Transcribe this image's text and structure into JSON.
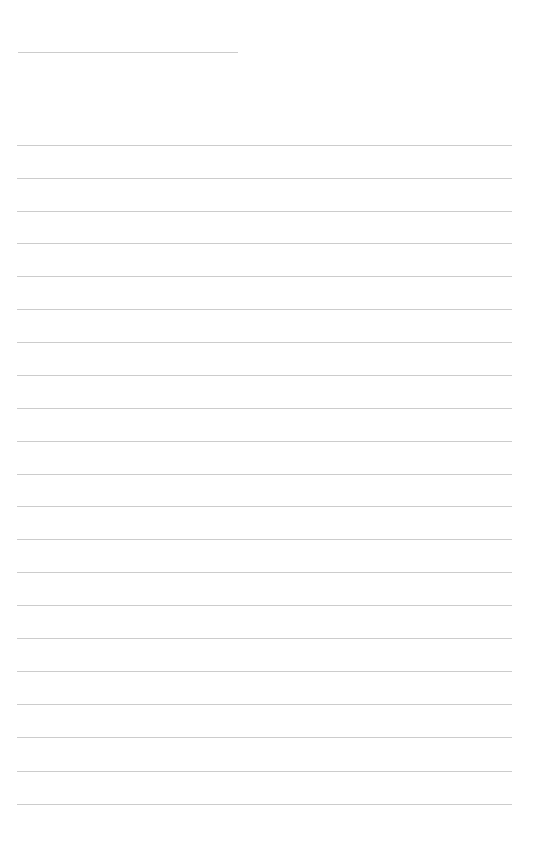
{
  "document": {
    "type": "lined-notebook-page",
    "background_color": "#ffffff",
    "line_color": "#cccccc",
    "header_line": {
      "x": 18,
      "y": 52,
      "width": 220
    },
    "ruled_lines": {
      "x": 17,
      "width": 495,
      "y_positions": [
        145,
        178,
        211,
        243,
        276,
        309,
        342,
        375,
        408,
        441,
        474,
        506,
        539,
        572,
        605,
        638,
        671,
        704,
        737,
        771,
        804
      ]
    }
  }
}
